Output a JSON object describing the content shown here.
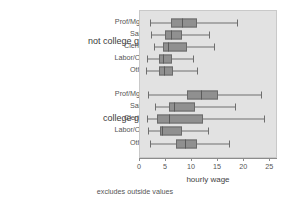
{
  "chart_data": {
    "type": "box",
    "title": "",
    "xlabel": "hourly wage",
    "ylabel": "",
    "note": "excludes outside values",
    "xlim": [
      0,
      26.5
    ],
    "xticks": [
      0,
      5,
      10,
      15,
      20,
      25
    ],
    "xtick_labels": [
      "0",
      "5",
      "10",
      "15",
      "20",
      "25"
    ],
    "grid": false,
    "legend": "none",
    "orientation": "horizontal",
    "plot_background": "#e2e2e2",
    "box_fill": "#909090",
    "box_edge": "#6a6a6a",
    "groups": [
      {
        "label": "not college grad",
        "categories": [
          {
            "label": "Prof/Mgmt",
            "whisker_low": 2.0,
            "q1": 6.0,
            "median": 8.0,
            "q3": 11.0,
            "whisker_high": 18.7
          },
          {
            "label": "Sales",
            "whisker_low": 2.2,
            "q1": 4.8,
            "median": 6.0,
            "q3": 8.0,
            "whisker_high": 13.2
          },
          {
            "label": "Clerical",
            "whisker_low": 2.6,
            "q1": 4.4,
            "median": 5.3,
            "q3": 9.0,
            "whisker_high": 14.2
          },
          {
            "label": "Labor/Ops",
            "whisker_low": 1.3,
            "q1": 3.7,
            "median": 4.4,
            "q3": 6.1,
            "whisker_high": 10.2
          },
          {
            "label": "Other",
            "whisker_low": 1.1,
            "q1": 3.6,
            "median": 4.6,
            "q3": 6.3,
            "whisker_high": 11.0
          }
        ]
      },
      {
        "label": "college grad",
        "categories": [
          {
            "label": "Prof/Mgmt",
            "whisker_low": 1.6,
            "q1": 9.0,
            "median": 11.7,
            "q3": 14.9,
            "whisker_high": 23.3
          },
          {
            "label": "Sales",
            "whisker_low": 2.8,
            "q1": 5.5,
            "median": 6.6,
            "q3": 10.5,
            "whisker_high": 18.3
          },
          {
            "label": "Clerical",
            "whisker_low": 1.4,
            "q1": 3.2,
            "median": 5.6,
            "q3": 12.1,
            "whisker_high": 23.8
          },
          {
            "label": "Labor/Ops",
            "whisker_low": 1.5,
            "q1": 3.8,
            "median": 4.3,
            "q3": 8.0,
            "whisker_high": 13.1
          },
          {
            "label": "Other",
            "whisker_low": 2.0,
            "q1": 7.0,
            "median": 8.6,
            "q3": 11.0,
            "whisker_high": 17.0
          }
        ]
      }
    ]
  }
}
